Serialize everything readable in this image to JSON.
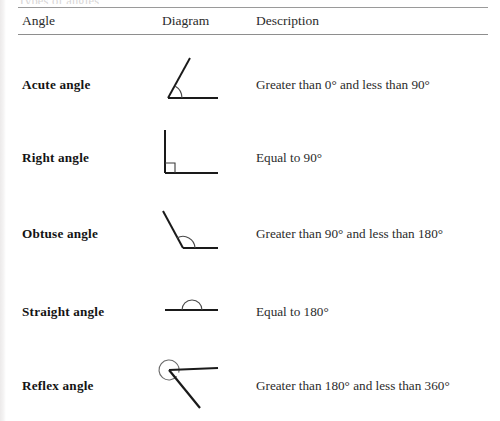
{
  "document": {
    "clipped_top_text": "Types of angles",
    "table": {
      "columns": [
        {
          "key": "angle",
          "label": "Angle"
        },
        {
          "key": "diagram",
          "label": "Diagram"
        },
        {
          "key": "description",
          "label": "Description"
        }
      ],
      "rows": [
        {
          "angle": "Acute angle",
          "diagram": "acute-angle-diagram",
          "description": "Greater than 0° and less than 90°"
        },
        {
          "angle": "Right angle",
          "diagram": "right-angle-diagram",
          "description": "Equal to 90°"
        },
        {
          "angle": "Obtuse angle",
          "diagram": "obtuse-angle-diagram",
          "description": "Greater than 90° and less than 180°"
        },
        {
          "angle": "Straight angle",
          "diagram": "straight-angle-diagram",
          "description": "Equal to 180°"
        },
        {
          "angle": "Reflex angle",
          "diagram": "reflex-angle-diagram",
          "description": "Greater than 180° and less than 360°"
        }
      ]
    },
    "colors": {
      "ink": "#1c1c1c",
      "rule": "#8e8e8e",
      "stroke": "#1a1a1a",
      "page": "#ffffff"
    }
  }
}
